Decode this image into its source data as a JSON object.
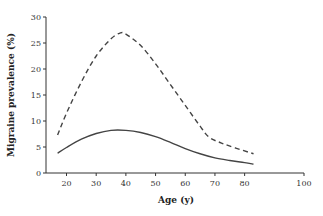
{
  "chart_data": {
    "type": "line",
    "title": "",
    "xlabel": "Age (y)",
    "ylabel": "Migraine prevalence (%)",
    "xlim": [
      14,
      100
    ],
    "ylim": [
      0,
      30
    ],
    "xticks": [
      20,
      30,
      40,
      50,
      60,
      70,
      80,
      100
    ],
    "yticks": [
      0,
      5,
      10,
      15,
      20,
      25,
      30
    ],
    "grid": false,
    "legend": null,
    "series": [
      {
        "name": "dashed",
        "style": "dashed",
        "color": "#444444",
        "x": [
          17,
          20,
          25,
          30,
          35,
          38,
          40,
          45,
          50,
          55,
          60,
          65,
          68,
          72,
          77,
          83
        ],
        "y": [
          7.3,
          11.5,
          17.5,
          22.5,
          25.8,
          26.9,
          26.7,
          24.5,
          21.0,
          17.0,
          13.0,
          9.0,
          6.9,
          5.8,
          4.8,
          3.7
        ]
      },
      {
        "name": "solid",
        "style": "solid",
        "color": "#444444",
        "x": [
          17,
          20,
          25,
          30,
          35,
          40,
          45,
          50,
          55,
          60,
          65,
          70,
          75,
          80,
          83
        ],
        "y": [
          3.8,
          4.9,
          6.5,
          7.6,
          8.2,
          8.2,
          7.8,
          7.0,
          5.9,
          4.7,
          3.7,
          2.9,
          2.4,
          2.0,
          1.7
        ]
      }
    ]
  }
}
